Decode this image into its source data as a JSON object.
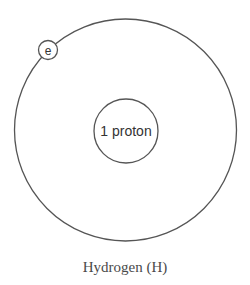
{
  "diagram": {
    "title": "Hydrogen (H)",
    "nucleus": {
      "label": "1 proton"
    },
    "electron": {
      "label": "e"
    },
    "colors": {
      "stroke": "#555555",
      "text": "#333333",
      "background": "#ffffff"
    }
  }
}
